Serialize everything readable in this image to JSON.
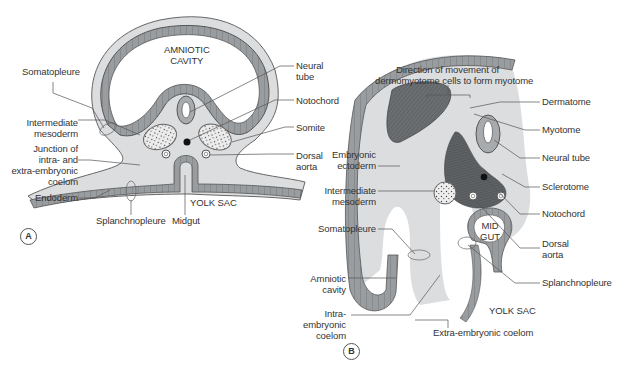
{
  "figure": {
    "colors": {
      "mesoderm_fill": "#dcdddf",
      "ectoderm_fill": "#9a9da0",
      "ectoderm_cells": "#7e8184",
      "dermomyotome_fill": "#6c6f72",
      "sclerotome_fill": "#5f6265",
      "neural_tube_fill": "#a8abae",
      "line_color": "#555555",
      "background": "#ffffff"
    },
    "panel_a": {
      "badge": "A",
      "cavity_label": [
        "AMNIOTIC",
        "CAVITY"
      ],
      "yolk_sac_label": "YOLK SAC",
      "labels": {
        "somatopleure": "Somatopleure",
        "intermediate_mesoderm": [
          "Intermediate",
          "mesoderm"
        ],
        "junction": [
          "Junction of",
          "intra- and",
          "extra-embryonic",
          "coelom"
        ],
        "endoderm": "Endoderm",
        "splanchnopleure": "Splanchnopleure",
        "midgut": "Midgut",
        "neural_tube": [
          "Neural",
          "tube"
        ],
        "notochord": "Notochord",
        "somite": "Somite",
        "dorsal_aorta": [
          "Dorsal",
          "aorta"
        ]
      }
    },
    "panel_b": {
      "badge": "B",
      "direction_note": [
        "Direction of movement of",
        "dermomyotome cells to form myotome"
      ],
      "midgut_label": [
        "MID",
        "GUT"
      ],
      "yolk_sac_label": "YOLK SAC",
      "labels": {
        "embryonic_ectoderm": [
          "Embryonic",
          "ectoderm"
        ],
        "intermediate_mesoderm": [
          "Intermediate",
          "mesoderm"
        ],
        "somatopleure": "Somatopleure",
        "amniotic_cavity": [
          "Amniotic",
          "cavity"
        ],
        "intra_embryonic_coelom": [
          "Intra-",
          "embryonic",
          "coelom"
        ],
        "extra_embryonic_coelom": "Extra-embryonic coelom",
        "dermatome": "Dermatome",
        "myotome": "Myotome",
        "neural_tube": "Neural tube",
        "sclerotome": "Sclerotome",
        "notochord": "Notochord",
        "dorsal_aorta": [
          "Dorsal",
          "aorta"
        ],
        "splanchnopleure": "Splanchnopleure"
      }
    }
  }
}
